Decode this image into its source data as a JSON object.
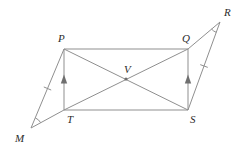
{
  "figure": {
    "kind": "geometry-diagram",
    "background_color": "#ffffff",
    "stroke_color": "#8f8f8f",
    "label_color": "#2b2b2b",
    "width": 242,
    "height": 154
  },
  "points": {
    "P": {
      "label": "P",
      "x": 64,
      "y": 49,
      "label_x": 58,
      "label_y": 42
    },
    "Q": {
      "label": "Q",
      "x": 188,
      "y": 49,
      "label_x": 182,
      "label_y": 42
    },
    "T": {
      "label": "T",
      "x": 64,
      "y": 110,
      "label_x": 67,
      "label_y": 123
    },
    "S": {
      "label": "S",
      "x": 188,
      "y": 110,
      "label_x": 190,
      "label_y": 123
    },
    "V": {
      "label": "V",
      "x": 126,
      "y": 79,
      "label_x": 124,
      "label_y": 73
    },
    "M": {
      "label": "M",
      "x": 31,
      "y": 128,
      "label_x": 15,
      "label_y": 142
    },
    "R": {
      "label": "R",
      "x": 220,
      "y": 22,
      "label_x": 224,
      "label_y": 16
    }
  },
  "segments": [
    {
      "name": "PQ",
      "from": "P",
      "to": "Q"
    },
    {
      "name": "TS",
      "from": "T",
      "to": "S"
    },
    {
      "name": "PT",
      "from": "P",
      "to": "T"
    },
    {
      "name": "QS",
      "from": "Q",
      "to": "S"
    },
    {
      "name": "PS",
      "from": "P",
      "to": "S"
    },
    {
      "name": "QT",
      "from": "Q",
      "to": "T"
    },
    {
      "name": "PM",
      "from": "P",
      "to": "M"
    },
    {
      "name": "TM",
      "from": "T",
      "to": "M"
    },
    {
      "name": "QR",
      "from": "Q",
      "to": "R"
    },
    {
      "name": "SR",
      "from": "S",
      "to": "R"
    }
  ],
  "markers": {
    "tick_marks": [
      {
        "name": "tick-on-PM",
        "segment": "PM",
        "count": 1
      },
      {
        "name": "tick-on-SR",
        "segment": "SR",
        "count": 1
      }
    ],
    "arrow_marks": [
      {
        "name": "arrow-on-PT",
        "segment": "PT",
        "direction": "up"
      },
      {
        "name": "arrow-on-QS",
        "segment": "QS",
        "direction": "up"
      }
    ],
    "angle_arcs": [
      {
        "name": "angle-arc-at-M",
        "vertex": "M"
      },
      {
        "name": "angle-arc-at-R",
        "vertex": "R"
      }
    ]
  }
}
